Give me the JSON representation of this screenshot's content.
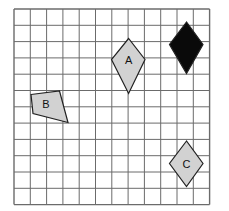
{
  "figure": {
    "title": "",
    "background_color": "#ffffff",
    "grid": {
      "name": "square-grid",
      "columns": 12,
      "rows": 12,
      "cell_size_px": 16.3,
      "origin_x_px": 14,
      "origin_y_px": 9,
      "line_color": "#6b6b6b",
      "line_width_px": 1,
      "border_color": "#6b6b6b",
      "border_width_px": 1.4
    },
    "shape_style": {
      "fill_gray": "#d2d2d2",
      "fill_black": "#0a0a0a",
      "stroke": "#222222",
      "stroke_width_px": 1.2,
      "label_color": "#111111",
      "label_font_size_px": 11
    },
    "shapes": [
      {
        "id": "shape-a",
        "label": "A",
        "type": "kite",
        "fill": "#d2d2d2",
        "points": "128.6,38.5 111.5,59.5 128.6,93.5 145.0,59.5",
        "label_x": 128.6,
        "label_y": 59.5
      },
      {
        "id": "shape-black-kite",
        "label": "",
        "type": "kite",
        "fill": "#0a0a0a",
        "points": "186.5,22.0 169.5,44.5 186.5,73.5 203.0,44.5",
        "label_x": 186.5,
        "label_y": 45.0
      },
      {
        "id": "shape-b",
        "label": "B",
        "type": "quadrilateral",
        "fill": "#d2d2d2",
        "points": "31.0,94.5 59.5,91.0 68.0,122.5 33.0,113.5",
        "label_x": 46.0,
        "label_y": 104.0
      },
      {
        "id": "shape-c",
        "label": "C",
        "type": "kite",
        "fill": "#d2d2d2",
        "points": "186.5,141.0 169.5,163.5 186.5,186.5 203.0,163.5",
        "label_x": 186.5,
        "label_y": 163.5
      }
    ]
  }
}
